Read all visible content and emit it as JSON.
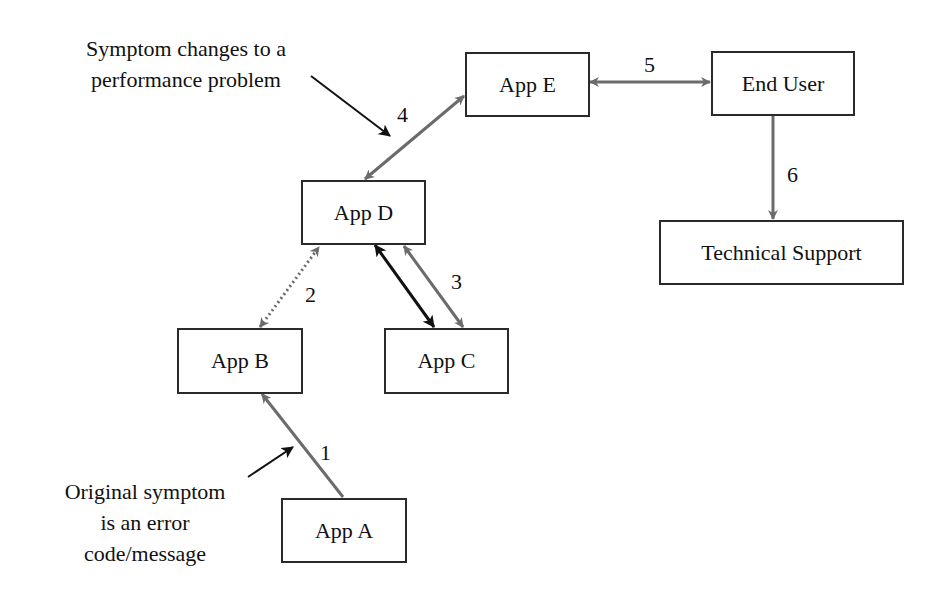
{
  "nodes": {
    "app_a": "App A",
    "app_b": "App B",
    "app_c": "App C",
    "app_d": "App D",
    "app_e": "App E",
    "end_user": "End User",
    "tech_support": "Technical Support"
  },
  "edges": [
    {
      "label": "1",
      "from": "App A",
      "to": "App B",
      "style": "solid gray, single arrow"
    },
    {
      "label": "2",
      "from": "App B",
      "to": "App D",
      "style": "dotted gray, bidirectional"
    },
    {
      "label": "3",
      "from": "App D",
      "to": "App C",
      "style": "solid black + solid gray, bidirectional"
    },
    {
      "label": "4",
      "from": "App D",
      "to": "App E",
      "style": "solid gray, bidirectional"
    },
    {
      "label": "5",
      "from": "App E",
      "to": "End User",
      "style": "solid gray, bidirectional"
    },
    {
      "label": "6",
      "from": "End User",
      "to": "Technical Support",
      "style": "solid gray, single arrow"
    }
  ],
  "edge_labels": {
    "e1": "1",
    "e2": "2",
    "e3": "3",
    "e4": "4",
    "e5": "5",
    "e6": "6"
  },
  "annotations": {
    "top": {
      "line1": "Symptom changes to a",
      "line2": "performance problem"
    },
    "bottom": {
      "line1": "Original symptom",
      "line2": "is an error",
      "line3": "code/message"
    }
  },
  "colors": {
    "gray_edge": "#6b6b6b",
    "black_edge": "#111111",
    "box_border": "#2a2a2a"
  }
}
